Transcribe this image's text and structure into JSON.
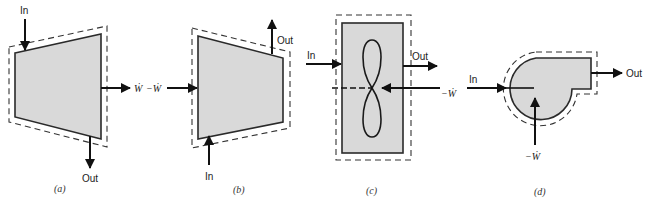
{
  "figure": {
    "panels": [
      {
        "id": "a",
        "caption": "(a)",
        "description": "Turbine-like control volume: flow in from top-left, out at bottom, work output to the right",
        "labels": {
          "in": "In",
          "out": "Out",
          "work": "Ẇ"
        }
      },
      {
        "id": "b",
        "caption": "(b)",
        "description": "Compressor-like control volume: work input from left, flow in at bottom, out at top",
        "labels": {
          "in": "In",
          "out": "Out",
          "work": "−Ẇ"
        }
      },
      {
        "id": "c",
        "caption": "(c)",
        "description": "Fan/propeller in a duct: flow in on left, out on right, work input via shaft",
        "labels": {
          "in": "In",
          "out": "Out",
          "work": "−Ẇ"
        }
      },
      {
        "id": "d",
        "caption": "(d)",
        "description": "Centrifugal pump/blower: flow in at left, out at right, work input from below",
        "labels": {
          "in": "In",
          "out": "Out",
          "work": "−Ẇ"
        }
      }
    ],
    "colors": {
      "fill": "#d9d9d9",
      "stroke": "#2a2a2a",
      "background": "#ffffff"
    }
  }
}
